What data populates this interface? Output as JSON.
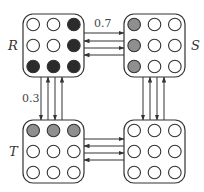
{
  "diagram": {
    "type": "state-transition",
    "colors": {
      "stroke": "#333333",
      "filled": "#2b2b2b",
      "gray": "#8f8f8f",
      "empty": "#ffffff"
    },
    "boxes": [
      {
        "id": "R",
        "label": "R",
        "x": 23,
        "y": 14,
        "w": 61,
        "h": 63,
        "label_pos": "left",
        "cells": [
          [
            "empty",
            "empty",
            "filled"
          ],
          [
            "empty",
            "empty",
            "filled"
          ],
          [
            "filled",
            "filled",
            "filled"
          ]
        ]
      },
      {
        "id": "S",
        "label": "S",
        "x": 124,
        "y": 14,
        "w": 61,
        "h": 63,
        "label_pos": "right",
        "cells": [
          [
            "gray",
            "empty",
            "empty"
          ],
          [
            "gray",
            "empty",
            "empty"
          ],
          [
            "gray",
            "empty",
            "empty"
          ]
        ]
      },
      {
        "id": "T",
        "label": "T",
        "x": 23,
        "y": 120,
        "w": 61,
        "h": 63,
        "label_pos": "left",
        "cells": [
          [
            "gray",
            "gray",
            "gray"
          ],
          [
            "empty",
            "empty",
            "empty"
          ],
          [
            "empty",
            "empty",
            "empty"
          ]
        ]
      },
      {
        "id": "U",
        "label": "",
        "x": 124,
        "y": 120,
        "w": 61,
        "h": 63,
        "label_pos": "none",
        "cells": [
          [
            "empty",
            "empty",
            "empty"
          ],
          [
            "empty",
            "empty",
            "empty"
          ],
          [
            "empty",
            "empty",
            "empty"
          ]
        ]
      }
    ],
    "edges": [
      {
        "from": "R",
        "to": "S",
        "label": "0.7",
        "orientation": "horizontal",
        "positions": [
          33,
          41,
          48,
          55
        ],
        "directions": [
          "right",
          "left",
          "right",
          "left"
        ]
      },
      {
        "from": "R",
        "to": "T",
        "label": "0.3",
        "orientation": "vertical",
        "positions": [
          41,
          48,
          55,
          62
        ],
        "directions": [
          "down",
          "up",
          "down",
          "up"
        ]
      },
      {
        "from": "S",
        "to": "U",
        "label": "",
        "orientation": "vertical",
        "positions": [
          143,
          150,
          157,
          164
        ],
        "directions": [
          "down",
          "up",
          "down",
          "up"
        ]
      },
      {
        "from": "T",
        "to": "U",
        "label": "",
        "orientation": "horizontal",
        "positions": [
          139,
          146,
          153,
          160
        ],
        "directions": [
          "right",
          "left",
          "right",
          "left"
        ]
      }
    ],
    "edge_labels": {
      "rs": "0.7",
      "rt": "0.3"
    },
    "box_labels": {
      "R": "R",
      "S": "S",
      "T": "T"
    }
  }
}
